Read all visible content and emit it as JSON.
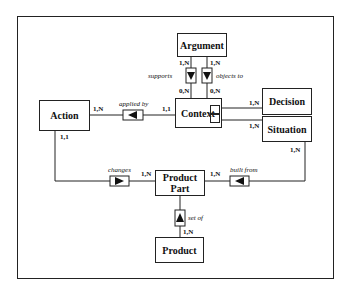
{
  "entities": {
    "argument": "Argument",
    "action": "Action",
    "context": "Context",
    "decision": "Decision",
    "situation": "Situation",
    "product_part": "Product Part",
    "product": "Product"
  },
  "relationships": {
    "supports": "supports",
    "objects_to": "objects to",
    "applied_by": "applied by",
    "changes": "changes",
    "built_from": "built from",
    "set_of": "set of"
  },
  "cardinalities": {
    "argument_supports": "1,N",
    "argument_objects": "1,N",
    "context_supports": "0,N",
    "context_objects": "0,N",
    "action_applied": "1,N",
    "context_applied": "1,1",
    "decision_context": "1,N",
    "situation_context": "1,N",
    "action_changes": "1,1",
    "productpart_changes": "1,N",
    "productpart_built": "1,N",
    "situation_built": "1,N",
    "product_setof": "1,N"
  }
}
